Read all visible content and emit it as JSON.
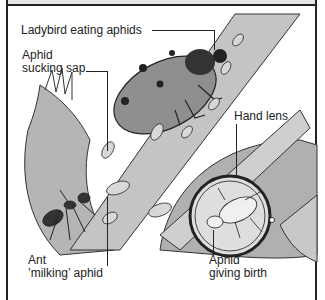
{
  "figure": {
    "title_cropped": "",
    "labels": {
      "ladybird": "Ladybird eating aphids",
      "aphid_sap_line1": "Aphid",
      "aphid_sap_line2": "sucking sap",
      "hand_lens": "Hand lens",
      "ant_line1": "Ant",
      "ant_line2": "’milking’ aphid",
      "birth_line1": "Aphid",
      "birth_line2": "giving birth"
    },
    "colors": {
      "ink": "#222222",
      "stem": "#bdbdbd",
      "leaf": "#a9a9a9",
      "ladybird": "#8c8c8c",
      "lens_bg": "#dcdcdc",
      "background": "#ffffff"
    }
  }
}
